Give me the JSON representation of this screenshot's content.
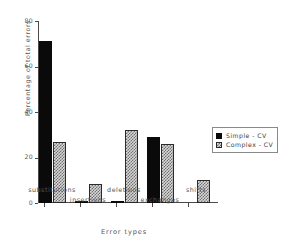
{
  "chart_data": {
    "type": "bar",
    "title": "",
    "xlabel": "Error types",
    "ylabel": "Percentage of total errors",
    "categories": [
      "substitutions",
      "insertions",
      "deletions",
      "exchanges",
      "shifts"
    ],
    "series": [
      {
        "name": "Simple - CV",
        "values": [
          71,
          1,
          1,
          29,
          0
        ],
        "fill": "solid-black",
        "color": "#0a0a0a"
      },
      {
        "name": "Complex - CV",
        "values": [
          27,
          8.5,
          32,
          26,
          10
        ],
        "fill": "checkered-gray",
        "color": "#d8d8d8"
      }
    ],
    "ylim": [
      0,
      80
    ],
    "yticks": [
      0,
      20,
      40,
      60,
      80
    ],
    "ytick_labels": [
      "0",
      "20",
      "40",
      "60",
      "80"
    ],
    "grid": false,
    "legend_position": "right"
  },
  "legend": {
    "entries": [
      {
        "label": "Simple - CV"
      },
      {
        "label": "Complex - CV"
      }
    ]
  },
  "axes": {
    "y_title": "Percentage of total errors",
    "x_title": "Error types"
  }
}
